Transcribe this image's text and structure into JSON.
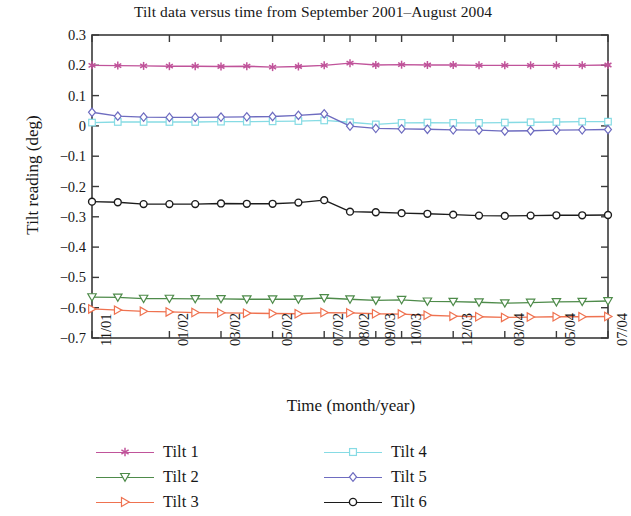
{
  "chart_data": {
    "type": "line",
    "title": "Tilt data versus time from September 2001–August 2004",
    "xlabel": "Time (month/year)",
    "ylabel": "Tilt reading (deg)",
    "ylim": [
      -0.7,
      0.3
    ],
    "yticks": [
      0.3,
      0.2,
      0.1,
      0,
      -0.1,
      -0.2,
      -0.3,
      -0.4,
      -0.5,
      -0.6,
      -0.7
    ],
    "ytick_labels": [
      "0.3",
      "0.2",
      "0.1",
      "0",
      "−0.1",
      "−0.2",
      "−0.3",
      "−0.4",
      "−0.5",
      "−0.6",
      "−0.7"
    ],
    "xtick_labels": [
      "11/01",
      "01/02",
      "03/02",
      "05/02",
      "07/02",
      "08/02",
      "09/03",
      "10/03",
      "12/03",
      "03/04",
      "05/04",
      "07/04"
    ],
    "xtick_indices": [
      0,
      3,
      5,
      7,
      9,
      10,
      11,
      12,
      14,
      16,
      18,
      20
    ],
    "n_points": 21,
    "grid": false,
    "legend_position": "below-plot",
    "series": [
      {
        "name": "Tilt 1",
        "color": "#c0539a",
        "marker": "star",
        "values": [
          0.2,
          0.199,
          0.198,
          0.197,
          0.197,
          0.196,
          0.197,
          0.194,
          0.196,
          0.2,
          0.207,
          0.201,
          0.202,
          0.201,
          0.201,
          0.2,
          0.2,
          0.2,
          0.2,
          0.2,
          0.201
        ]
      },
      {
        "name": "Tilt 2",
        "color": "#4e8b4a",
        "marker": "triangle-down",
        "values": [
          -0.565,
          -0.566,
          -0.57,
          -0.57,
          -0.571,
          -0.571,
          -0.572,
          -0.572,
          -0.572,
          -0.568,
          -0.572,
          -0.576,
          -0.574,
          -0.579,
          -0.58,
          -0.582,
          -0.585,
          -0.583,
          -0.581,
          -0.58,
          -0.578
        ]
      },
      {
        "name": "Tilt 3",
        "color": "#ef7250",
        "marker": "triangle-right",
        "values": [
          -0.604,
          -0.608,
          -0.612,
          -0.614,
          -0.616,
          -0.617,
          -0.618,
          -0.619,
          -0.62,
          -0.616,
          -0.617,
          -0.62,
          -0.621,
          -0.625,
          -0.628,
          -0.63,
          -0.632,
          -0.631,
          -0.63,
          -0.63,
          -0.629
        ]
      },
      {
        "name": "Tilt 4",
        "color": "#86dbe4",
        "marker": "square",
        "values": [
          0.011,
          0.013,
          0.013,
          0.013,
          0.013,
          0.014,
          0.014,
          0.015,
          0.016,
          0.018,
          0.012,
          0.005,
          0.01,
          0.011,
          0.01,
          0.01,
          0.011,
          0.012,
          0.013,
          0.014,
          0.014
        ]
      },
      {
        "name": "Tilt 5",
        "color": "#6e6cc0",
        "marker": "diamond",
        "values": [
          0.045,
          0.032,
          0.029,
          0.028,
          0.028,
          0.029,
          0.03,
          0.031,
          0.035,
          0.04,
          -0.001,
          -0.008,
          -0.01,
          -0.011,
          -0.013,
          -0.014,
          -0.017,
          -0.016,
          -0.014,
          -0.013,
          -0.012
        ]
      },
      {
        "name": "Tilt 6",
        "color": "#1c1c1c",
        "marker": "circle",
        "values": [
          -0.25,
          -0.252,
          -0.258,
          -0.258,
          -0.258,
          -0.256,
          -0.257,
          -0.257,
          -0.253,
          -0.245,
          -0.283,
          -0.285,
          -0.288,
          -0.29,
          -0.293,
          -0.296,
          -0.297,
          -0.296,
          -0.295,
          -0.295,
          -0.294
        ]
      }
    ]
  },
  "legend": {
    "entries": [
      {
        "label": "Tilt 1"
      },
      {
        "label": "Tilt 2"
      },
      {
        "label": "Tilt 3"
      },
      {
        "label": "Tilt 4"
      },
      {
        "label": "Tilt 5"
      },
      {
        "label": "Tilt 6"
      }
    ]
  }
}
